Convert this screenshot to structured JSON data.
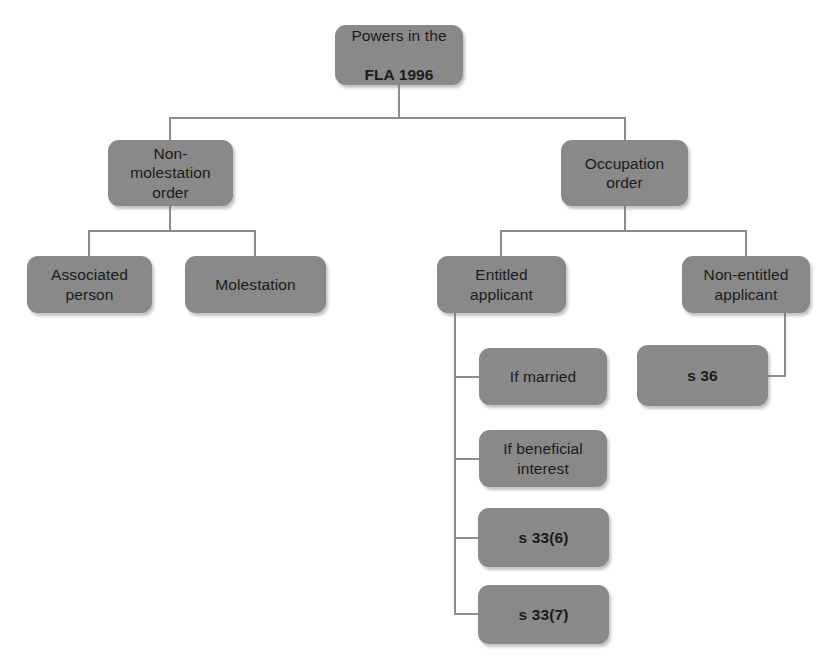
{
  "diagram": {
    "title_node": {
      "id": "powers-fla-1996",
      "line1": "Powers in the",
      "line2": "FLA 1996",
      "x": 335,
      "y": 25,
      "w": 128,
      "h": 60
    },
    "nodes": [
      {
        "id": "non-molestation-order",
        "label": "Non-\nmolestation\norder",
        "bold": false,
        "x": 108,
        "y": 140,
        "w": 125,
        "h": 66
      },
      {
        "id": "occupation-order",
        "label": "Occupation\norder",
        "bold": false,
        "x": 561,
        "y": 140,
        "w": 127,
        "h": 66
      },
      {
        "id": "associated-person",
        "label": "Associated\nperson",
        "bold": false,
        "x": 27,
        "y": 256,
        "w": 125,
        "h": 57
      },
      {
        "id": "molestation",
        "label": "Molestation",
        "bold": false,
        "x": 185,
        "y": 256,
        "w": 141,
        "h": 57
      },
      {
        "id": "entitled-applicant",
        "label": "Entitled\napplicant",
        "bold": false,
        "x": 437,
        "y": 256,
        "w": 129,
        "h": 57
      },
      {
        "id": "non-entitled-applicant",
        "label": "Non-entitled\napplicant",
        "bold": false,
        "x": 682,
        "y": 256,
        "w": 128,
        "h": 57
      },
      {
        "id": "if-married",
        "label": "If married",
        "bold": false,
        "x": 479,
        "y": 348,
        "w": 128,
        "h": 57
      },
      {
        "id": "s-36",
        "label": "s 36",
        "bold": true,
        "x": 637,
        "y": 345,
        "w": 131,
        "h": 61
      },
      {
        "id": "if-beneficial-interest",
        "label": "If beneficial\ninterest",
        "bold": false,
        "x": 479,
        "y": 430,
        "w": 128,
        "h": 57
      },
      {
        "id": "s-33-6",
        "label": "s 33(6)",
        "bold": true,
        "x": 478,
        "y": 508,
        "w": 131,
        "h": 59
      },
      {
        "id": "s-33-7",
        "label": "s 33(7)",
        "bold": true,
        "x": 478,
        "y": 585,
        "w": 131,
        "h": 59
      }
    ],
    "connector_color": "#8c8c8c",
    "connector_width": 1.4,
    "edges": [
      {
        "from": "powers-fla-1996",
        "to": "non-molestation-order",
        "style": "elbow-down"
      },
      {
        "from": "powers-fla-1996",
        "to": "occupation-order",
        "style": "elbow-down"
      },
      {
        "from": "non-molestation-order",
        "to": "associated-person",
        "style": "elbow-down"
      },
      {
        "from": "non-molestation-order",
        "to": "molestation",
        "style": "elbow-down"
      },
      {
        "from": "occupation-order",
        "to": "entitled-applicant",
        "style": "elbow-down"
      },
      {
        "from": "occupation-order",
        "to": "non-entitled-applicant",
        "style": "elbow-down"
      },
      {
        "from": "entitled-applicant",
        "to": "if-married",
        "style": "side-stem"
      },
      {
        "from": "entitled-applicant",
        "to": "if-beneficial-interest",
        "style": "side-stem"
      },
      {
        "from": "entitled-applicant",
        "to": "s-33-6",
        "style": "side-stem"
      },
      {
        "from": "entitled-applicant",
        "to": "s-33-7",
        "style": "side-stem"
      },
      {
        "from": "non-entitled-applicant",
        "to": "s-36",
        "style": "right-elbow"
      }
    ]
  },
  "colors": {
    "node_fill": "#898989",
    "node_text": "#1b1b1b",
    "connector": "#8c8c8c",
    "background": "#ffffff"
  }
}
